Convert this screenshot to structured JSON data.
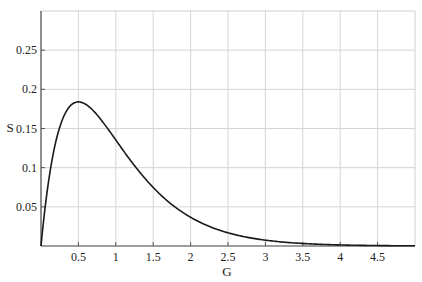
{
  "chart_data": {
    "type": "line",
    "title": "",
    "xlabel": "G",
    "ylabel": "S",
    "xlim": [
      0,
      5
    ],
    "ylim": [
      0,
      0.3
    ],
    "grid": true,
    "legend": null,
    "x_ticks": [
      0.5,
      1,
      1.5,
      2,
      2.5,
      3,
      3.5,
      4,
      4.5
    ],
    "x_tick_labels": [
      "0.5",
      "1",
      "1.5",
      "2",
      "2.5",
      "3",
      "3.5",
      "4",
      "4.5"
    ],
    "y_ticks": [
      0.05,
      0.1,
      0.15,
      0.2,
      0.25
    ],
    "y_tick_labels": [
      "0.05",
      "0.1",
      "0.15",
      "0.2",
      "0.25"
    ],
    "series": [
      {
        "name": "S(G)",
        "color": "#1a1a1a",
        "x": [
          0,
          0.1,
          0.2,
          0.3,
          0.4,
          0.5,
          0.6,
          0.7,
          0.8,
          0.9,
          1.0,
          1.25,
          1.5,
          1.75,
          2.0,
          2.5,
          3.0,
          3.5,
          4.0,
          4.5,
          5.0
        ],
        "values": [
          0,
          0.082,
          0.134,
          0.165,
          0.18,
          0.184,
          0.181,
          0.173,
          0.162,
          0.149,
          0.135,
          0.103,
          0.075,
          0.053,
          0.037,
          0.017,
          0.007,
          0.003,
          0.001,
          0.001,
          0.0
        ]
      }
    ],
    "peak": {
      "x": 0.5,
      "y": 0.184
    }
  }
}
